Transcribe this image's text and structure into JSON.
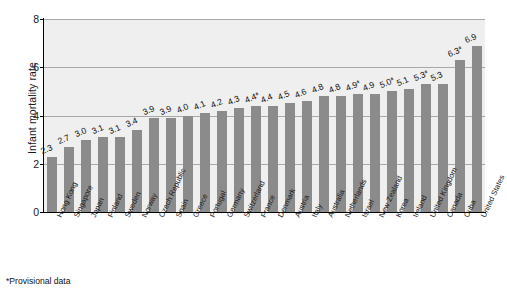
{
  "chart_data": {
    "type": "bar",
    "title": "",
    "xlabel": "",
    "ylabel": "Infant mortality rate",
    "ylim": [
      0,
      8
    ],
    "yticks": [
      0,
      2,
      4,
      6,
      8
    ],
    "grid": true,
    "legend": "none",
    "orientation": "vertical",
    "bar_color": "#8b8b8b",
    "plot_background": "#efefef",
    "categories": [
      "Hong Kong",
      "Singapore",
      "Japan",
      "Finland",
      "Sweden",
      "Norway",
      "Czech Republic",
      "Spain",
      "Greece",
      "Portugal",
      "Germany",
      "Switzerland",
      "France",
      "Denmark",
      "Austria",
      "Italy",
      "Australia",
      "Netherlands",
      "Israel",
      "New Zealand",
      "Korea",
      "Ireland",
      "United Kingdom",
      "Canada",
      "Cuba",
      "United States"
    ],
    "values": [
      2.3,
      2.7,
      3.0,
      3.1,
      3.1,
      3.4,
      3.9,
      3.9,
      4.0,
      4.1,
      4.2,
      4.3,
      4.4,
      4.4,
      4.5,
      4.6,
      4.8,
      4.8,
      4.9,
      4.9,
      5.0,
      5.1,
      5.3,
      5.3,
      6.3,
      6.9
    ],
    "value_labels": [
      "2.3",
      "2.7",
      "3.0",
      "3.1",
      "3.1",
      "3.4",
      "3.9",
      "3.9",
      "4.0",
      "4.1",
      "4.2",
      "4.3",
      "4.4*",
      "4.4",
      "4.5",
      "4.6",
      "4.8",
      "4.8",
      "4.9*",
      "4.9",
      "5.0*",
      "5.1",
      "5.3*",
      "5.3",
      "6.3*",
      "6.9"
    ],
    "provisional": [
      false,
      false,
      false,
      false,
      false,
      false,
      false,
      false,
      false,
      false,
      false,
      false,
      true,
      false,
      false,
      false,
      false,
      false,
      true,
      false,
      true,
      false,
      true,
      false,
      true,
      false
    ],
    "annotations": [
      "*Provisional data"
    ]
  },
  "footnote": "*Provisional data"
}
